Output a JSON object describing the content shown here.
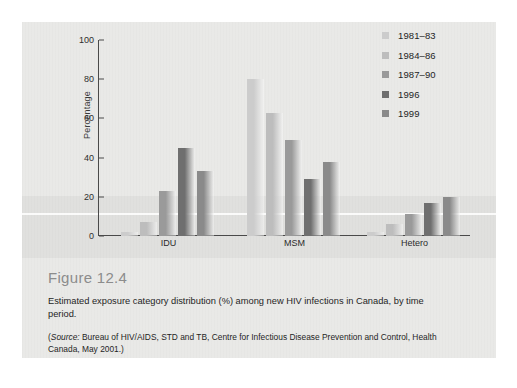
{
  "figure": {
    "title": "Figure 12.4",
    "description": "Estimated exposure category distribution (%) among new HIV infections in Canada, by time period.",
    "source_prefix": "(",
    "source_italic": "Source:",
    "source_text": " Bureau of HIV/AIDS, STD and TB, Centre for Infectious Disease Prevention and Control, Health Canada, May 2001.)"
  },
  "chart_data": {
    "type": "bar",
    "title": "",
    "xlabel": "",
    "ylabel": "Percentage",
    "categories": [
      "IDU",
      "MSM",
      "Hetero"
    ],
    "ylim": [
      0,
      100
    ],
    "yticks": [
      0,
      20,
      40,
      60,
      80,
      100
    ],
    "ytick_labels": [
      "0",
      "20",
      "40",
      "60",
      "80",
      "100"
    ],
    "grid": false,
    "legend_position": "top-right",
    "series": [
      {
        "name": "1981–83",
        "color": "#cccccc",
        "values": [
          2,
          80,
          2
        ]
      },
      {
        "name": "1984–86",
        "color": "#bdbdbd",
        "values": [
          7,
          63,
          6
        ]
      },
      {
        "name": "1987–90",
        "color": "#9a9a9a",
        "values": [
          23,
          49,
          11
        ]
      },
      {
        "name": "1996",
        "color": "#6f6f6f",
        "values": [
          45,
          29,
          17
        ]
      },
      {
        "name": "1999",
        "color": "#8a8a8a",
        "values": [
          33,
          38,
          20
        ]
      }
    ]
  }
}
